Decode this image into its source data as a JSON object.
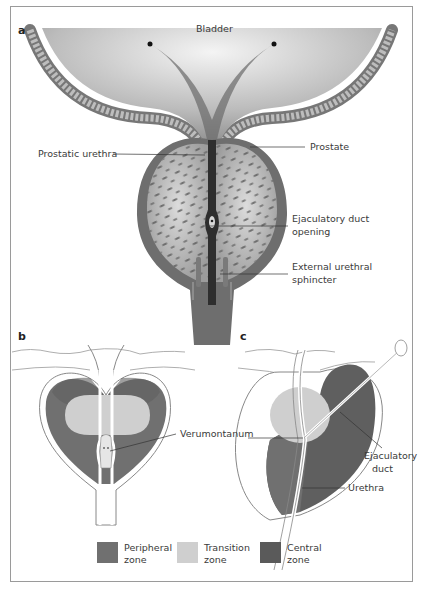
{
  "figure": {
    "panels": [
      {
        "letter": "a",
        "title_label": "Bladder",
        "labels": {
          "prostatic_urethra": "Prostatic urethra",
          "prostate": "Prostate",
          "ejaculatory_duct_opening_line1": "Ejaculatory duct",
          "ejaculatory_duct_opening_line2": "opening",
          "external_urethral_sphincter_line1": "External urethral",
          "external_urethral_sphincter_line2": "sphincter"
        }
      },
      {
        "letter": "b",
        "labels": {
          "verumontanum": "Verumontanum"
        }
      },
      {
        "letter": "c",
        "labels": {
          "ejaculatory_duct_line1": "Ejaculatory",
          "ejaculatory_duct_line2": "duct",
          "urethra": "Urethra"
        }
      }
    ],
    "legend": [
      {
        "line1": "Peripheral",
        "line2": "zone",
        "color": "#707070"
      },
      {
        "line1": "Transition",
        "line2": "zone",
        "color": "#cfcfcf"
      },
      {
        "line1": "Central",
        "line2": "zone",
        "color": "#5a5a5a"
      }
    ]
  }
}
